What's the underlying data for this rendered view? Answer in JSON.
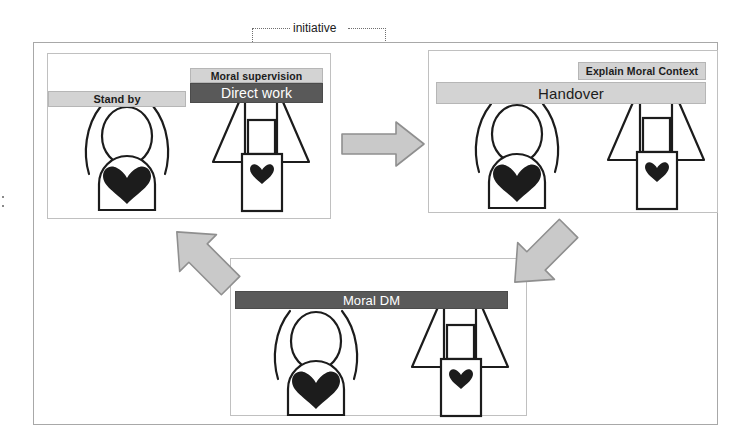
{
  "diagram": {
    "title_annotation": "initiative",
    "colors": {
      "bar_light": "#d3d3d3",
      "bar_dark": "#595959",
      "arrow_fill": "#c9c9c9",
      "arrow_stroke": "#8f8f8f",
      "frame": "#a8a8a8",
      "panel_border": "#c0c0c0",
      "figure_stroke": "#1c1c1c",
      "heart_fill": "#1c1c1c"
    },
    "panels": [
      {
        "id": "standby-direct",
        "name": "panel-standby-direct",
        "bars": [
          {
            "id": "stand-by",
            "label": "Stand by",
            "style": "light"
          },
          {
            "id": "moral-supervision",
            "label": "Moral supervision",
            "style": "light"
          },
          {
            "id": "direct-work",
            "label": "Direct work",
            "style": "dark"
          }
        ],
        "actors": [
          "human",
          "robot"
        ]
      },
      {
        "id": "handover",
        "name": "panel-handover",
        "bars": [
          {
            "id": "handover",
            "label": "Handover",
            "style": "light"
          },
          {
            "id": "explain-moral-context",
            "label": "Explain Moral Context",
            "style": "light"
          }
        ],
        "actors": [
          "human",
          "robot"
        ]
      },
      {
        "id": "moral-dm",
        "name": "panel-moral-dm",
        "bars": [
          {
            "id": "moral-dm",
            "label": "Moral DM",
            "style": "dark"
          }
        ],
        "actors": [
          "human",
          "robot"
        ]
      }
    ],
    "arrows": [
      {
        "id": "standby-to-handover",
        "direction": "right",
        "from": "standby-direct",
        "to": "handover"
      },
      {
        "id": "handover-to-moral-dm",
        "direction": "down-left",
        "from": "handover",
        "to": "moral-dm"
      },
      {
        "id": "moral-dm-to-standby",
        "direction": "up-left",
        "from": "moral-dm",
        "to": "standby-direct"
      }
    ],
    "annotations": [
      {
        "id": "initiative",
        "label": "initiative",
        "style": "dotted",
        "targets": [
          "direct-work",
          "standby-to-handover"
        ]
      }
    ]
  }
}
